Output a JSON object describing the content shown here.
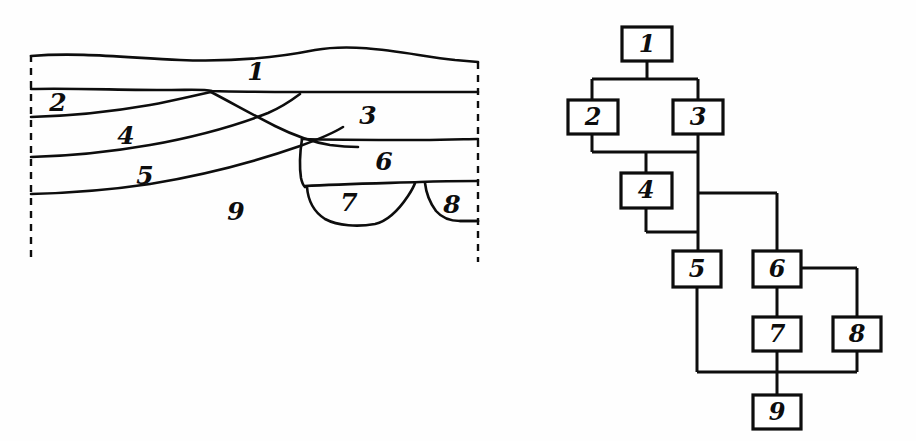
{
  "figure": {
    "ink_color": "#0d0d0d",
    "background_color": "#ffffff"
  },
  "section_panel": {
    "name": "archaeological-section-drawing",
    "description": "Hand-drawn vertical section through deposits with nine numbered contexts",
    "left_boundary_style": "dashed",
    "right_boundary_style": "dashed",
    "labels": [
      {
        "id": "1",
        "text": "1",
        "x": 256,
        "y": 73
      },
      {
        "id": "2",
        "text": "2",
        "x": 58,
        "y": 104
      },
      {
        "id": "3",
        "text": "3",
        "x": 368,
        "y": 117
      },
      {
        "id": "4",
        "text": "4",
        "x": 126,
        "y": 137
      },
      {
        "id": "5",
        "text": "5",
        "x": 145,
        "y": 177
      },
      {
        "id": "6",
        "text": "6",
        "x": 384,
        "y": 163
      },
      {
        "id": "7",
        "text": "7",
        "x": 349,
        "y": 204
      },
      {
        "id": "8",
        "text": "8",
        "x": 452,
        "y": 206
      },
      {
        "id": "9",
        "text": "9",
        "x": 236,
        "y": 213
      }
    ]
  },
  "matrix_panel": {
    "name": "harris-matrix-diagram",
    "description": "Flow chart of stratigraphic relationships between the nine contexts",
    "nodes": [
      {
        "id": "1",
        "text": "1",
        "x": 622,
        "y": 27,
        "w": 50,
        "h": 34
      },
      {
        "id": "2",
        "text": "2",
        "x": 568,
        "y": 100,
        "w": 50,
        "h": 34
      },
      {
        "id": "3",
        "text": "3",
        "x": 673,
        "y": 100,
        "w": 50,
        "h": 34
      },
      {
        "id": "4",
        "text": "4",
        "x": 621,
        "y": 173,
        "w": 51,
        "h": 35
      },
      {
        "id": "5",
        "text": "5",
        "x": 673,
        "y": 251,
        "w": 48,
        "h": 36
      },
      {
        "id": "6",
        "text": "6",
        "x": 753,
        "y": 251,
        "w": 48,
        "h": 36
      },
      {
        "id": "7",
        "text": "7",
        "x": 753,
        "y": 317,
        "w": 48,
        "h": 34
      },
      {
        "id": "8",
        "text": "8",
        "x": 833,
        "y": 317,
        "w": 48,
        "h": 34
      },
      {
        "id": "9",
        "text": "9",
        "x": 753,
        "y": 395,
        "w": 48,
        "h": 34
      }
    ],
    "edges": [
      {
        "from": "1",
        "to": "2",
        "label": "1-above-2"
      },
      {
        "from": "1",
        "to": "3",
        "label": "1-above-3"
      },
      {
        "from": "2",
        "to": "4",
        "label": "2-above-4"
      },
      {
        "from": "3",
        "to": "4",
        "label": "3-above-4"
      },
      {
        "from": "3",
        "to": "5",
        "label": "3-above-5"
      },
      {
        "from": "4",
        "to": "5",
        "label": "4-above-5"
      },
      {
        "from": "3",
        "to": "6",
        "label": "3-above-6"
      },
      {
        "from": "6",
        "to": "7",
        "label": "6-above-7"
      },
      {
        "from": "6",
        "to": "8",
        "label": "6-above-8"
      },
      {
        "from": "5",
        "to": "9",
        "label": "5-above-9"
      },
      {
        "from": "7",
        "to": "9",
        "label": "7-above-9"
      },
      {
        "from": "8",
        "to": "9",
        "label": "8-above-9"
      }
    ]
  }
}
